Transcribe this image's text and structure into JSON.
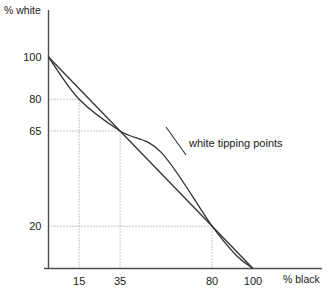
{
  "chart_data": {
    "type": "line",
    "title": "",
    "xlabel": "% black",
    "ylabel": "% white",
    "xlim": [
      0,
      133
    ],
    "ylim": [
      0,
      113
    ],
    "grid": true,
    "legend": null,
    "xticks": [
      {
        "value": 15,
        "label": "15"
      },
      {
        "value": 35,
        "label": "35"
      },
      {
        "value": 80,
        "label": "80"
      },
      {
        "value": 100,
        "label": "100"
      }
    ],
    "yticks": [
      {
        "value": 100,
        "label": "100"
      },
      {
        "value": 80,
        "label": "80"
      },
      {
        "value": 65,
        "label": "65"
      },
      {
        "value": 20,
        "label": "20"
      }
    ],
    "series": [
      {
        "name": "linear reference",
        "style": "straight",
        "points": [
          {
            "x": 0,
            "y": 100
          },
          {
            "x": 100,
            "y": 0
          }
        ]
      },
      {
        "name": "white tipping points",
        "style": "s-curve",
        "points": [
          {
            "x": 0,
            "y": 100
          },
          {
            "x": 15,
            "y": 80
          },
          {
            "x": 35,
            "y": 65
          },
          {
            "x": 55,
            "y": 55
          },
          {
            "x": 80,
            "y": 20
          },
          {
            "x": 92,
            "y": 6
          },
          {
            "x": 100,
            "y": 0
          }
        ]
      }
    ],
    "annotations": [
      {
        "text": "white tipping points",
        "x": 82,
        "y": 50,
        "has_leader": true
      }
    ],
    "crossings": [
      {
        "x": 35,
        "y": 65
      },
      {
        "x": 80,
        "y": 20
      }
    ],
    "guides": [
      {
        "type": "horizontal",
        "value": 80,
        "from_x": 0,
        "to_x": 15
      },
      {
        "type": "horizontal",
        "value": 65,
        "from_x": 0,
        "to_x": 35
      },
      {
        "type": "horizontal",
        "value": 20,
        "from_x": 0,
        "to_x": 80
      },
      {
        "type": "vertical",
        "value": 15,
        "from_y": 0,
        "to_y": 80
      },
      {
        "type": "vertical",
        "value": 35,
        "from_y": 0,
        "to_y": 65
      },
      {
        "type": "vertical",
        "value": 80,
        "from_y": 0,
        "to_y": 20
      }
    ],
    "colors": {
      "curve": "#333333",
      "axis": "#4d4d4d",
      "grid": "#808080",
      "text": "#1a1a1a",
      "background": "#ffffff"
    }
  }
}
